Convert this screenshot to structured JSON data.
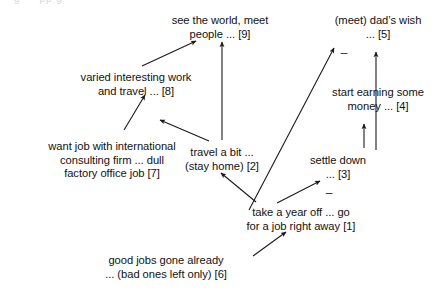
{
  "diagram": {
    "type": "cognitive-causal-map",
    "title_fragment_cut_off_top": "g     pp g",
    "nodes": [
      {
        "id": "9",
        "label_lines": [
          "see the world, meet",
          "people ... [9]"
        ],
        "x": 220,
        "y": 14
      },
      {
        "id": "5",
        "label_lines": [
          "(meet) dad’s wish",
          "... [5]"
        ],
        "x": 378,
        "y": 14
      },
      {
        "id": "8",
        "label_lines": [
          "varied interesting work",
          "and travel ... [8]"
        ],
        "x": 136,
        "y": 71
      },
      {
        "id": "4",
        "label_lines": [
          "start earning some",
          "money ... [4]"
        ],
        "x": 378,
        "y": 86
      },
      {
        "id": "7",
        "label_lines": [
          "want job with international",
          "consulting firm ... dull",
          "factory office job [7]"
        ],
        "x": 112,
        "y": 140
      },
      {
        "id": "2",
        "label_lines": [
          "travel a bit ...",
          "(stay home) [2]"
        ],
        "x": 222,
        "y": 146
      },
      {
        "id": "3",
        "label_lines": [
          "settle down",
          "... [3]"
        ],
        "x": 338,
        "y": 154
      },
      {
        "id": "1",
        "label_lines": [
          "take a year off ... go",
          "for a job right away [1]"
        ],
        "x": 301,
        "y": 206
      },
      {
        "id": "6",
        "label_lines": [
          "good jobs gone already",
          "... (bad ones left only) [6]"
        ],
        "x": 166,
        "y": 254
      }
    ],
    "edges": [
      {
        "from": "8",
        "to": "9",
        "sign": "",
        "x1": 142,
        "y1": 66,
        "x2": 196,
        "y2": 41
      },
      {
        "from": "2",
        "to": "9",
        "sign": "",
        "x1": 222,
        "y1": 140,
        "x2": 222,
        "y2": 42
      },
      {
        "from": "7",
        "to": "8",
        "sign": "",
        "x1": 124,
        "y1": 130,
        "x2": 145,
        "y2": 95
      },
      {
        "from": "2",
        "to": "7",
        "sign": "",
        "x1": 209,
        "y1": 141,
        "x2": 160,
        "y2": 120
      },
      {
        "from": "1",
        "to": "2",
        "sign": "",
        "x1": 256,
        "y1": 202,
        "x2": 221,
        "y2": 173
      },
      {
        "from": "1",
        "to": "5",
        "sign": "–",
        "x1": 249,
        "y1": 210,
        "x2": 334,
        "y2": 48
      },
      {
        "from": "4",
        "to": "5",
        "sign": "",
        "x1": 376,
        "y1": 150,
        "x2": 376,
        "y2": 52
      },
      {
        "from": "3",
        "to": "4",
        "sign": "",
        "x1": 364,
        "y1": 148,
        "x2": 364,
        "y2": 124
      },
      {
        "from": "1",
        "to": "3",
        "sign": "–",
        "x1": 277,
        "y1": 203,
        "x2": 320,
        "y2": 181
      },
      {
        "from": "6",
        "to": "1",
        "sign": "",
        "x1": 253,
        "y1": 256,
        "x2": 286,
        "y2": 232
      }
    ],
    "sign_markers": [
      {
        "symbol": "–",
        "x": 344,
        "y": 53
      },
      {
        "symbol": "–",
        "x": 329,
        "y": 193
      }
    ],
    "colors": {
      "background": "#ffffff",
      "text": "#111111",
      "line": "#1a1a1a"
    }
  }
}
